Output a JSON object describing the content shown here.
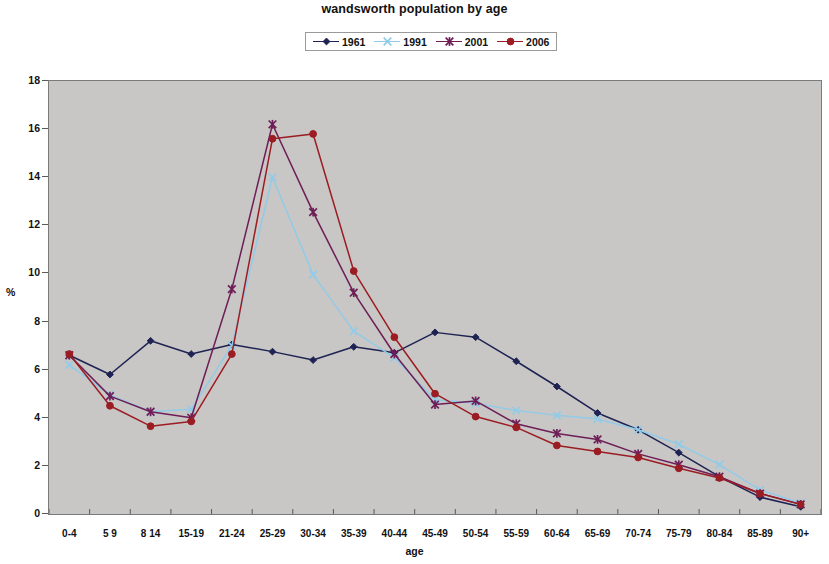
{
  "chart_data": {
    "type": "line",
    "title": "wandsworth population by age",
    "xlabel": "age",
    "ylabel": "%",
    "ylim": [
      0,
      18
    ],
    "ytick_step": 2,
    "yticks": [
      "0",
      "2",
      "4",
      "6",
      "8",
      "10",
      "12",
      "14",
      "16",
      "18"
    ],
    "grid": false,
    "legend_position": "top-center",
    "plot_background": "#c8c7c5",
    "categories": [
      "0-4",
      "5 9",
      "8 14",
      "15-19",
      "21-24",
      "25-29",
      "30-34",
      "35-39",
      "40-44",
      "45-49",
      "50-54",
      "55-59",
      "60-64",
      "65-69",
      "70-74",
      "75-79",
      "80-84",
      "85-89",
      "90+"
    ],
    "series": [
      {
        "name": "1961",
        "color": "#1f2353",
        "marker": "diamond",
        "values": [
          6.6,
          5.8,
          7.2,
          6.65,
          7.05,
          6.75,
          6.4,
          6.95,
          6.7,
          7.55,
          7.35,
          6.35,
          5.3,
          4.2,
          3.5,
          2.55,
          1.55,
          0.7,
          0.3
        ]
      },
      {
        "name": "1991",
        "color": "#92cbe8",
        "marker": "x",
        "values": [
          6.2,
          4.95,
          4.25,
          4.35,
          7.0,
          14.0,
          9.95,
          7.6,
          6.5,
          4.75,
          4.6,
          4.3,
          4.1,
          3.95,
          3.5,
          2.9,
          2.05,
          1.0,
          0.45
        ]
      },
      {
        "name": "2001",
        "color": "#6e1d56",
        "marker": "asterisk",
        "values": [
          6.6,
          4.9,
          4.25,
          4.0,
          9.35,
          16.2,
          12.55,
          9.2,
          6.65,
          4.55,
          4.7,
          3.75,
          3.35,
          3.1,
          2.5,
          2.05,
          1.55,
          0.85,
          0.4
        ]
      },
      {
        "name": "2006",
        "color": "#9c1c23",
        "marker": "circle",
        "values": [
          6.65,
          4.5,
          3.65,
          3.85,
          6.65,
          15.6,
          15.8,
          10.1,
          7.35,
          5.0,
          4.05,
          3.6,
          2.85,
          2.6,
          2.35,
          1.9,
          1.5,
          0.85,
          0.4
        ]
      }
    ]
  },
  "legend": {
    "items": [
      {
        "label": "1961"
      },
      {
        "label": "1991"
      },
      {
        "label": "2001"
      },
      {
        "label": "2006"
      }
    ]
  }
}
